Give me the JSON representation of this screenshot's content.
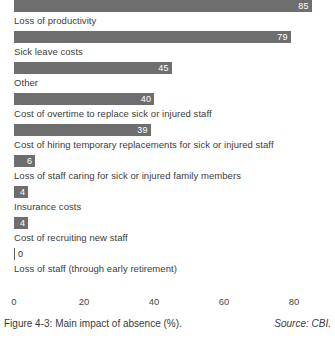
{
  "chart_data": {
    "type": "bar",
    "orientation": "horizontal",
    "title": "",
    "xlabel": "",
    "ylabel": "",
    "xlim": [
      0,
      85
    ],
    "axis_ticks": [
      {
        "label": "0",
        "value": 0
      },
      {
        "label": "20",
        "value": 20
      },
      {
        "label": "40",
        "value": 40
      },
      {
        "label": "60",
        "value": 60
      },
      {
        "label": "80",
        "value": 80
      }
    ],
    "grid": false,
    "legend": "none",
    "bar_color": "#6e6e6e",
    "value_label_color": "#ffffff",
    "categories": [
      "Loss of productivity",
      "Sick leave costs",
      "Other",
      "Cost of overtime to replace sick or injured staff",
      "Cost of hiring temporary replacements for sick or injured staff",
      "Loss of staff caring for sick or injured family members",
      "Insurance costs",
      "Cost of recruiting new staff",
      "Loss of staff (through early retirement)"
    ],
    "values": [
      85,
      79,
      45,
      40,
      39,
      6,
      4,
      4,
      0
    ],
    "value_labels": [
      "85",
      "79",
      "45",
      "40",
      "39",
      "6",
      "4",
      "4",
      "0"
    ],
    "bars": [
      {
        "label": "Loss of productivity",
        "value": 85,
        "value_label": "85"
      },
      {
        "label": "Sick leave costs",
        "value": 79,
        "value_label": "79"
      },
      {
        "label": "Other",
        "value": 45,
        "value_label": "45"
      },
      {
        "label": "Cost of overtime to replace sick or injured staff",
        "value": 40,
        "value_label": "40"
      },
      {
        "label": "Cost of hiring temporary replacements for sick or injured staff",
        "value": 39,
        "value_label": "39"
      },
      {
        "label": "Loss of staff caring for sick or injured family members",
        "value": 6,
        "value_label": "6"
      },
      {
        "label": "Insurance costs",
        "value": 4,
        "value_label": "4"
      },
      {
        "label": "Cost of recruiting new staff",
        "value": 4,
        "value_label": "4"
      },
      {
        "label": "Loss of staff (through early retirement)",
        "value": 0,
        "value_label": "0"
      }
    ]
  },
  "caption": {
    "text": "Figure 4-3: Main impact of absence (%).",
    "source": "Source: CBI."
  }
}
